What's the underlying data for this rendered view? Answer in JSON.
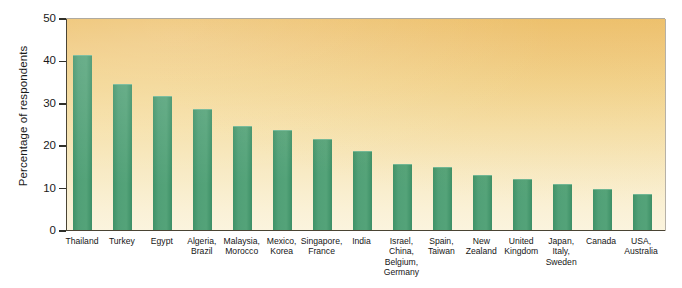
{
  "chart_data": {
    "type": "bar",
    "title": "",
    "xlabel": "",
    "ylabel": "Percentage of respondents",
    "ylim": [
      0,
      50
    ],
    "yticks": [
      0,
      10,
      20,
      30,
      40,
      50
    ],
    "ytick_labels": [
      "0",
      "10",
      "20",
      "30",
      "40",
      "50"
    ],
    "grid": false,
    "legend": "none",
    "bar_color": "#51a077",
    "plot_background_top": "#eec26f",
    "plot_background_bottom": "#fbf4de",
    "axis_color": "#4a4434",
    "categories": [
      "Thailand",
      "Turkey",
      "Egypt",
      "Algeria, Brazil",
      "Malaysia, Morocco",
      "Mexico, Korea",
      "Singapore, France",
      "India",
      "Israel, China, Belgium, Germany",
      "Spain, Taiwan",
      "New Zealand",
      "United Kingdom",
      "Japan, Italy, Sweden",
      "Canada",
      "USA, Australia"
    ],
    "category_lines": [
      [
        "Thailand"
      ],
      [
        "Turkey"
      ],
      [
        "Egypt"
      ],
      [
        "Algeria,",
        "Brazil"
      ],
      [
        "Malaysia,",
        "Morocco"
      ],
      [
        "Mexico,",
        "Korea"
      ],
      [
        "Singapore,",
        "France"
      ],
      [
        "India"
      ],
      [
        "Israel,",
        "China,",
        "Belgium,",
        "Germany"
      ],
      [
        "Spain,",
        "Taiwan"
      ],
      [
        "New",
        "Zealand"
      ],
      [
        "United",
        "Kingdom"
      ],
      [
        "Japan,",
        "Italy,",
        "Sweden"
      ],
      [
        "Canada"
      ],
      [
        "USA,",
        "Australia"
      ]
    ],
    "values": [
      41,
      34.2,
      31.3,
      28.4,
      24.2,
      23.3,
      21.3,
      18.4,
      15.3,
      14.6,
      12.7,
      11.8,
      10.7,
      9.5,
      8.3
    ]
  }
}
